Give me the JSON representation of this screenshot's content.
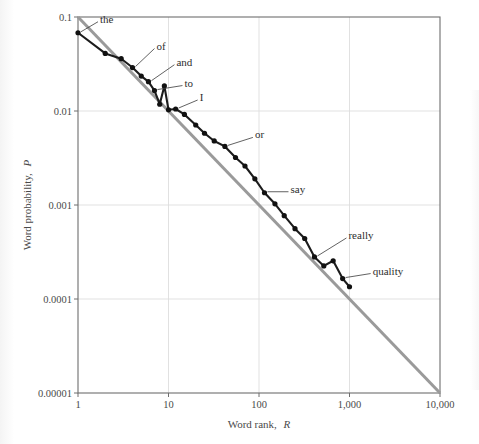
{
  "chart_data": {
    "type": "line",
    "title": "",
    "xlabel": "Word rank, R",
    "xlabel_text": "Word rank,",
    "xlabel_var": "R",
    "ylabel": "Word probability, P",
    "ylabel_text": "Word probability,",
    "ylabel_var": "P",
    "xscale": "log",
    "yscale": "log",
    "xlim": [
      1,
      10000
    ],
    "ylim": [
      1e-05,
      0.1
    ],
    "grid": true,
    "legend": "none",
    "xticks": [
      1,
      10,
      100,
      1000,
      10000
    ],
    "xtick_labels": [
      "1",
      "10",
      "100",
      "1,000",
      "10,000"
    ],
    "yticks": [
      0.1,
      0.01,
      0.001,
      0.0001,
      1e-05
    ],
    "ytick_labels": [
      "0.1",
      "0.01",
      "0.001",
      "0.0001",
      "0.00001"
    ],
    "series": [
      {
        "name": "word frequency data",
        "color": "#1c1c1c",
        "style": "line-with-markers",
        "x": [
          1,
          2,
          3,
          4,
          5,
          6,
          7,
          8,
          9,
          10,
          12,
          15,
          20,
          25,
          32,
          42,
          55,
          70,
          90,
          115,
          150,
          190,
          250,
          320,
          410,
          520,
          660,
          840,
          1000
        ],
        "y": [
          0.068,
          0.041,
          0.036,
          0.029,
          0.0235,
          0.0205,
          0.0165,
          0.0118,
          0.0185,
          0.0103,
          0.0105,
          0.0092,
          0.0071,
          0.0058,
          0.0048,
          0.0042,
          0.0032,
          0.0026,
          0.0019,
          0.00135,
          0.00103,
          0.00077,
          0.00056,
          0.00044,
          0.00028,
          0.000225,
          0.000255,
          0.000165,
          0.000135
        ]
      },
      {
        "name": "zipf reference line",
        "color": "#9a9a9a",
        "style": "straight-fit",
        "x": [
          1,
          10000
        ],
        "y": [
          0.1,
          1e-05
        ],
        "slope": -1
      }
    ],
    "annotations": [
      {
        "label": "the",
        "rank": 1,
        "prob": 0.068
      },
      {
        "label": "of",
        "rank": 4,
        "prob": 0.029
      },
      {
        "label": "and",
        "rank": 6,
        "prob": 0.0205
      },
      {
        "label": "to",
        "rank": 7,
        "prob": 0.0165
      },
      {
        "label": "I",
        "rank": 12,
        "prob": 0.0105
      },
      {
        "label": "or",
        "rank": 42,
        "prob": 0.0042
      },
      {
        "label": "say",
        "rank": 115,
        "prob": 0.00135
      },
      {
        "label": "really",
        "rank": 410,
        "prob": 0.00028
      },
      {
        "label": "quality",
        "rank": 840,
        "prob": 0.000165
      }
    ]
  },
  "colors": {
    "data_line": "#1c1c1c",
    "fit_line": "#9a9a9a",
    "grid": "#dedede",
    "frame": "#6e6e6e",
    "background": "#ffffff",
    "text": "#4a4a4a"
  }
}
